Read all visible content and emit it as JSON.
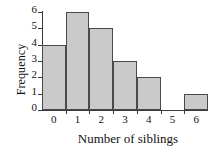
{
  "chart_data": {
    "type": "bar",
    "title": "",
    "subtitle": "",
    "xlabel": "Number of siblings",
    "ylabel": "Frequency",
    "categories": [
      "0",
      "1",
      "2",
      "3",
      "4",
      "5",
      "6"
    ],
    "values": [
      4,
      6,
      5,
      3,
      2,
      0,
      1
    ],
    "series": [
      {
        "name": "Frequency",
        "values": [
          4,
          6,
          5,
          3,
          2,
          0,
          1
        ]
      }
    ],
    "xticks": [
      "0",
      "1",
      "2",
      "3",
      "4",
      "5",
      "6"
    ],
    "yticks": [
      "0",
      "1",
      "2",
      "3",
      "4",
      "5",
      "6"
    ],
    "xlim": [
      -0.5,
      6.5
    ],
    "ylim": [
      0,
      6
    ],
    "grid": false,
    "legend": false,
    "bar_fill_color": "#cacaca",
    "bar_edge_color": "#4a4a4a",
    "axis_color": "#3a3a3a",
    "background_color": "#ffffff"
  }
}
